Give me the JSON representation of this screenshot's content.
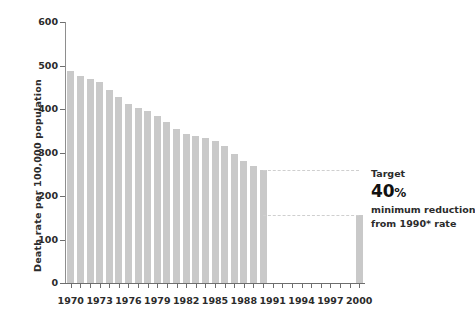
{
  "chart_data": {
    "type": "bar",
    "title": "",
    "xlabel": "",
    "ylabel": "Death rate per 100,000 population",
    "ylim": [
      0,
      600
    ],
    "xlim": [
      1969.4,
      2000.6
    ],
    "ytick_labels": [
      "600",
      "500",
      "400",
      "300",
      "200",
      "100",
      "0"
    ],
    "ytick_values": [
      600,
      500,
      400,
      300,
      200,
      100,
      0
    ],
    "xtick_labels": [
      "1970",
      "1973",
      "1976",
      "1979",
      "1982",
      "1985",
      "1988",
      "1991",
      "1994",
      "1997",
      "2000"
    ],
    "xtick_values": [
      1970,
      1973,
      1976,
      1979,
      1982,
      1985,
      1988,
      1991,
      1994,
      1997,
      2000
    ],
    "minor_xticks": [
      1971,
      1972,
      1974,
      1975,
      1977,
      1978,
      1980,
      1981,
      1983,
      1984,
      1986,
      1987,
      1989,
      1990,
      1992,
      1993,
      1995,
      1996,
      1998,
      1999
    ],
    "grid": false,
    "legend": null,
    "bar_color": "#c9c9c9",
    "categories": [
      1970,
      1971,
      1972,
      1973,
      1974,
      1975,
      1976,
      1977,
      1978,
      1979,
      1980,
      1981,
      1982,
      1983,
      1984,
      1985,
      1986,
      1987,
      1988,
      1989,
      1990,
      2000
    ],
    "values": [
      488,
      477,
      470,
      461,
      444,
      427,
      412,
      402,
      395,
      383,
      370,
      353,
      343,
      339,
      334,
      327,
      314,
      297,
      281,
      270,
      260,
      156
    ],
    "annotations": [
      {
        "name": "target-guide-upper",
        "type": "dashed-line",
        "y": 260,
        "x_from": 1990,
        "x_to": 2000
      },
      {
        "name": "target-guide-lower",
        "type": "dashed-line",
        "y": 156,
        "x_from": 1990,
        "x_to": 2000
      }
    ]
  },
  "annotation": {
    "title": "Target",
    "value": "40",
    "value_unit": "%",
    "line1": "minimum reduction",
    "line2": "from 1990* rate"
  }
}
